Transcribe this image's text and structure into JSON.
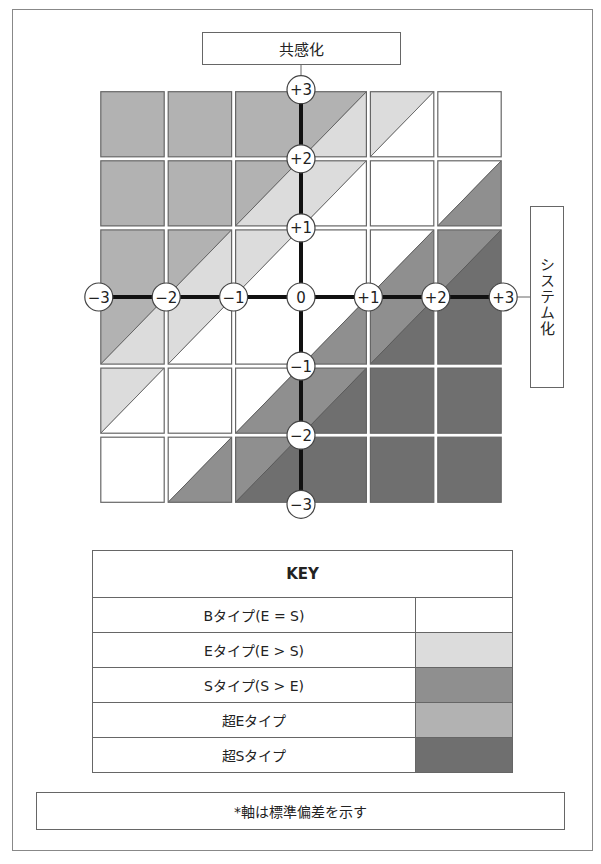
{
  "title": "共感化",
  "side_label": "システム化",
  "note": "*軸は標準偏差を示す",
  "axis": {
    "x_ticks": [
      "-3",
      "-2",
      "-1",
      "0",
      "+1",
      "+2",
      "+3"
    ],
    "y_ticks": [
      "+3",
      "+2",
      "+1",
      "-1",
      "-2",
      "-3"
    ]
  },
  "key": {
    "header": "KEY",
    "rows": [
      {
        "label": "Bタイプ(E = S)",
        "color": "#ffffff"
      },
      {
        "label": "Eタイプ(E > S)",
        "color": "#dcdcdc"
      },
      {
        "label": "Sタイプ(S > E)",
        "color": "#8f8f8f"
      },
      {
        "label": "超Eタイプ",
        "color": "#b2b2b2"
      },
      {
        "label": "超Sタイプ",
        "color": "#6f6f6f"
      }
    ]
  },
  "chart_data": {
    "type": "heatmap",
    "xlabel": "システム化 (S)",
    "ylabel": "共感化 (E)",
    "xlim": [
      -3,
      3
    ],
    "ylim": [
      -3,
      3
    ],
    "bands": [
      {
        "type": "超Eタイプ",
        "rule": "E - S > 2"
      },
      {
        "type": "Eタイプ",
        "rule": "1 < E - S < 2"
      },
      {
        "type": "Bタイプ",
        "rule": "-1 < E - S < 1"
      },
      {
        "type": "Sタイプ",
        "rule": "-2 < E - S < -1"
      },
      {
        "type": "超Sタイプ",
        "rule": "E - S < -2"
      }
    ],
    "cells_x": [
      [
        -3,
        -2
      ],
      [
        -2,
        -1
      ],
      [
        -1,
        1
      ],
      [
        1,
        2
      ],
      [
        2,
        3
      ]
    ],
    "cells_y": [
      [
        2,
        3
      ],
      [
        1,
        2
      ],
      [
        -1,
        1
      ],
      [
        -2,
        -1
      ],
      [
        -3,
        -2
      ]
    ]
  }
}
